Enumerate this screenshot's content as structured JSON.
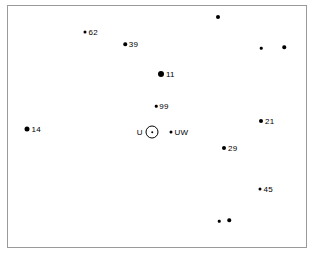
{
  "figure": {
    "title": "",
    "background_color": "#ffffff",
    "frame_color": "#9a9a9a",
    "marker_color": "#000000"
  },
  "chart_data": {
    "type": "scatter",
    "title": "",
    "xlabel": "",
    "ylabel": "",
    "xlim": [
      0,
      300
    ],
    "ylim": [
      0,
      243
    ],
    "grid": false,
    "legend": null,
    "axis_ticks": false,
    "axis_tick_labels": [],
    "annotations": [
      {
        "label": "U",
        "symbol": "sun-circled-dot"
      }
    ],
    "points": [
      {
        "name": "unlabeled-1",
        "label": "",
        "x": 210,
        "y": 11,
        "size": 4
      },
      {
        "name": "62",
        "label": "62",
        "x": 77,
        "y": 26,
        "size": 3
      },
      {
        "name": "39",
        "label": "39",
        "x": 117,
        "y": 38,
        "size": 3.5
      },
      {
        "name": "unlabeled-2",
        "label": "",
        "x": 253,
        "y": 42,
        "size": 2.5
      },
      {
        "name": "unlabeled-3",
        "label": "",
        "x": 276,
        "y": 41,
        "size": 3.5
      },
      {
        "name": "11",
        "label": "11",
        "x": 153,
        "y": 68,
        "size": 6
      },
      {
        "name": "99",
        "label": "99",
        "x": 148,
        "y": 100,
        "size": 2.5
      },
      {
        "name": "21",
        "label": "21",
        "x": 253,
        "y": 115,
        "size": 4
      },
      {
        "name": "14",
        "label": "14",
        "x": 19,
        "y": 123,
        "size": 5
      },
      {
        "name": "UW",
        "label": "UW",
        "x": 163,
        "y": 126,
        "size": 3
      },
      {
        "name": "29",
        "label": "29",
        "x": 216,
        "y": 142,
        "size": 4
      },
      {
        "name": "45",
        "label": "45",
        "x": 252,
        "y": 183,
        "size": 3
      },
      {
        "name": "unlabeled-4",
        "label": "",
        "x": 211,
        "y": 215,
        "size": 2.5
      },
      {
        "name": "unlabeled-5",
        "label": "",
        "x": 221,
        "y": 214,
        "size": 3.5
      }
    ],
    "sun": {
      "label": "U",
      "x": 144,
      "y": 126,
      "radius": 6.5
    }
  }
}
